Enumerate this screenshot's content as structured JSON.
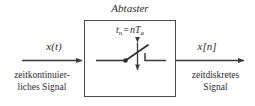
{
  "diagram": {
    "block": {
      "title": "Abtaster",
      "clock_formula": {
        "variable": "t",
        "variable_sub": "n",
        "operator": "=",
        "rhs_coeff": "n",
        "rhs_symbol": "T",
        "rhs_sub": "a",
        "plain": "t_n = nT_a"
      }
    },
    "input": {
      "signal_label": "x(t)",
      "caption_line1": "zeitkontinuier-",
      "caption_line2": "liches Signal"
    },
    "output": {
      "signal_label": "x[n]",
      "caption_line1": "zeitdiskretes",
      "caption_line2": "Signal"
    },
    "switch": {
      "name": "sampling-switch",
      "state": "open",
      "arrow_symbol": "double-headed-vertical-arrow"
    },
    "colors": {
      "stroke": "#3a3a3a",
      "box_border": "#4a4a4a",
      "text": "#2b2b2b",
      "background": "#ffffff"
    }
  }
}
